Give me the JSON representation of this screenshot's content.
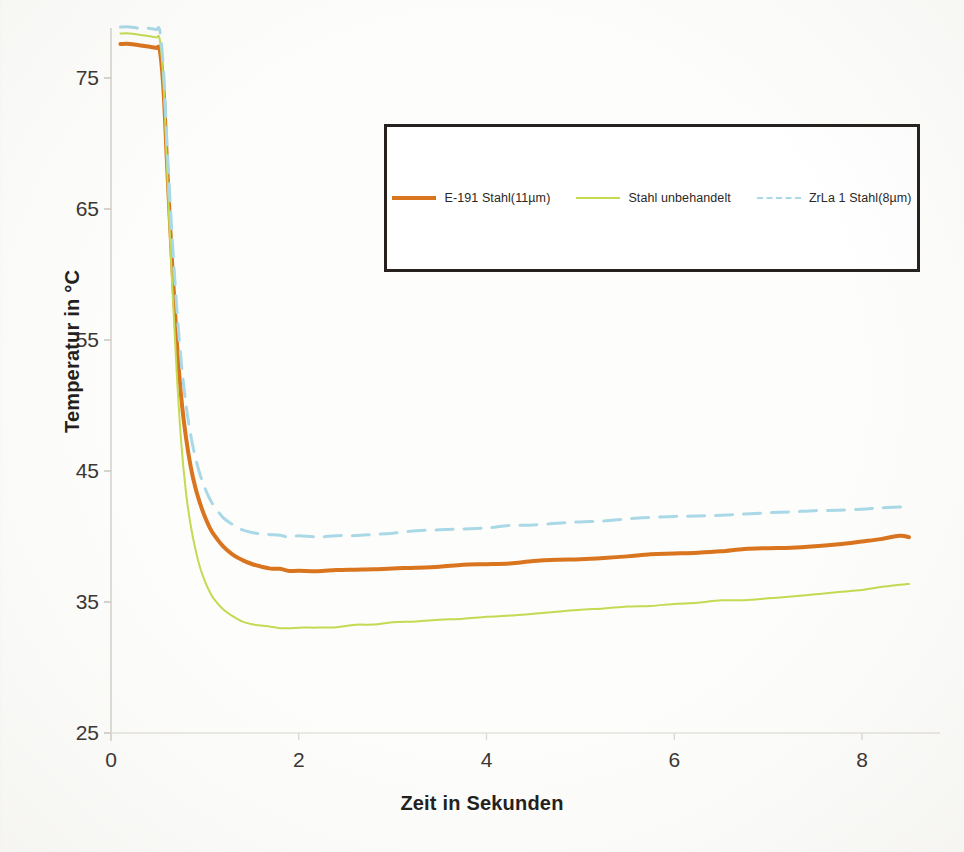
{
  "chart_data": {
    "type": "line",
    "title": "",
    "xlabel": "Zeit in Sekunden",
    "ylabel": "Temperatur in °C",
    "xlim": [
      0,
      8.6
    ],
    "ylim": [
      25,
      79.5
    ],
    "xticks": [
      0,
      2,
      4,
      6,
      8
    ],
    "yticks": [
      25,
      35,
      45,
      55,
      65,
      75
    ],
    "grid": false,
    "legend_position": "upper-center-inside-box",
    "series": [
      {
        "name": "E-191 Stahl(11µm)",
        "color": "#d9741f",
        "style": "solid",
        "width": 4,
        "x": [
          0.1,
          0.2,
          0.3,
          0.4,
          0.48,
          0.52,
          0.56,
          0.6,
          0.65,
          0.7,
          0.75,
          0.8,
          0.85,
          0.9,
          0.95,
          1.0,
          1.05,
          1.1,
          1.2,
          1.3,
          1.4,
          1.5,
          1.6,
          1.7,
          1.8,
          1.9,
          2.0,
          2.2,
          2.4,
          2.6,
          2.8,
          3.0,
          3.25,
          3.5,
          3.75,
          4.0,
          4.25,
          4.5,
          4.75,
          5.0,
          5.25,
          5.5,
          5.75,
          6.0,
          6.25,
          6.5,
          6.75,
          7.0,
          7.25,
          7.5,
          7.75,
          8.0,
          8.2,
          8.4,
          8.5
        ],
        "y": [
          77.6,
          77.6,
          77.5,
          77.4,
          77.3,
          77.1,
          74.0,
          68.0,
          61.0,
          55.0,
          50.5,
          47.5,
          45.3,
          43.7,
          42.5,
          41.5,
          40.7,
          40.1,
          39.2,
          38.6,
          38.2,
          37.9,
          37.7,
          37.6,
          37.5,
          37.4,
          37.35,
          37.4,
          37.4,
          37.45,
          37.5,
          37.55,
          37.6,
          37.7,
          37.8,
          37.9,
          38.0,
          38.1,
          38.2,
          38.3,
          38.4,
          38.5,
          38.6,
          38.7,
          38.8,
          38.9,
          39.0,
          39.1,
          39.2,
          39.3,
          39.4,
          39.6,
          39.8,
          40.0,
          40.0
        ]
      },
      {
        "name": "Stahl unbehandelt",
        "color": "#c3da52",
        "style": "solid",
        "width": 2,
        "x": [
          0.1,
          0.2,
          0.3,
          0.4,
          0.48,
          0.52,
          0.56,
          0.6,
          0.65,
          0.7,
          0.75,
          0.8,
          0.85,
          0.9,
          0.95,
          1.0,
          1.05,
          1.1,
          1.2,
          1.3,
          1.4,
          1.5,
          1.6,
          1.7,
          1.8,
          1.9,
          2.0,
          2.2,
          2.4,
          2.6,
          2.8,
          3.0,
          3.25,
          3.5,
          3.75,
          4.0,
          4.25,
          4.5,
          4.75,
          5.0,
          5.25,
          5.5,
          5.75,
          6.0,
          6.25,
          6.5,
          6.75,
          7.0,
          7.25,
          7.5,
          7.75,
          8.0,
          8.2,
          8.4,
          8.5
        ],
        "y": [
          78.4,
          78.4,
          78.3,
          78.2,
          78.1,
          77.9,
          74.5,
          67.5,
          59.5,
          52.5,
          47.0,
          43.3,
          40.8,
          39.0,
          37.6,
          36.6,
          35.8,
          35.2,
          34.4,
          33.9,
          33.5,
          33.3,
          33.2,
          33.1,
          33.05,
          33.0,
          33.0,
          33.05,
          33.1,
          33.2,
          33.3,
          33.4,
          33.5,
          33.6,
          33.75,
          33.9,
          34.0,
          34.1,
          34.25,
          34.4,
          34.5,
          34.6,
          34.7,
          34.85,
          35.0,
          35.1,
          35.2,
          35.3,
          35.45,
          35.6,
          35.75,
          35.9,
          36.1,
          36.3,
          36.4
        ]
      },
      {
        "name": "ZrLa 1 Stahl(8µm)",
        "color": "#a9d9e6",
        "style": "dashed",
        "width": 3,
        "x": [
          0.1,
          0.2,
          0.3,
          0.4,
          0.48,
          0.52,
          0.56,
          0.6,
          0.65,
          0.7,
          0.75,
          0.8,
          0.85,
          0.9,
          0.95,
          1.0,
          1.05,
          1.1,
          1.2,
          1.3,
          1.4,
          1.5,
          1.6,
          1.7,
          1.8,
          1.9,
          2.0,
          2.2,
          2.4,
          2.6,
          2.8,
          3.0,
          3.25,
          3.5,
          3.75,
          4.0,
          4.25,
          4.5,
          4.75,
          5.0,
          5.25,
          5.5,
          5.75,
          6.0,
          6.25,
          6.5,
          6.75,
          7.0,
          7.25,
          7.5,
          7.75,
          8.0,
          8.2,
          8.4,
          8.5
        ],
        "y": [
          78.9,
          78.9,
          78.8,
          78.8,
          78.7,
          78.6,
          75.5,
          69.5,
          63.0,
          57.5,
          53.2,
          50.0,
          47.7,
          46.0,
          44.7,
          43.7,
          42.9,
          42.3,
          41.4,
          40.9,
          40.5,
          40.3,
          40.2,
          40.1,
          40.05,
          40.0,
          40.0,
          40.0,
          40.05,
          40.1,
          40.2,
          40.25,
          40.4,
          40.5,
          40.6,
          40.7,
          40.8,
          40.9,
          41.0,
          41.1,
          41.2,
          41.3,
          41.4,
          41.5,
          41.55,
          41.6,
          41.7,
          41.8,
          41.9,
          41.95,
          42.0,
          42.1,
          42.2,
          42.3,
          42.3
        ]
      }
    ]
  },
  "legend": {
    "items": [
      {
        "label": "E-191 Stahl(11µm)",
        "color": "#d9741f",
        "style": "solid"
      },
      {
        "label": "Stahl unbehandelt",
        "color": "#c3da52",
        "style": "solid"
      },
      {
        "label": "ZrLa 1 Stahl(8µm)",
        "color": "#a9d9e6",
        "style": "dashed"
      }
    ]
  },
  "axes": {
    "x_title": "Zeit in Sekunden",
    "y_title": "Temperatur in °C",
    "x_tick_labels": [
      "0",
      "2",
      "4",
      "6",
      "8"
    ],
    "y_tick_labels": [
      "25",
      "35",
      "45",
      "55",
      "65",
      "75"
    ]
  },
  "colors": {
    "axis_text": "#3a3633",
    "title_text": "#231f1d",
    "legend_border": "#26211e",
    "background": "#fdfdfb"
  }
}
